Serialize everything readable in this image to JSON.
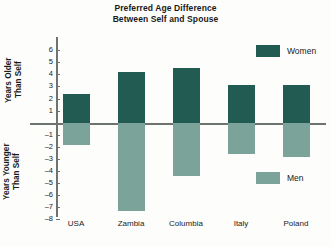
{
  "chart_data": {
    "type": "bar",
    "title": "Preferred Age Difference Between Self and Spouse",
    "title_lines": [
      "Preferred Age Difference",
      "Between Self and Spouse"
    ],
    "categories": [
      "USA",
      "Zambia",
      "Columbia",
      "Italy",
      "Poland"
    ],
    "series": [
      {
        "name": "Women",
        "axis": "upper",
        "color": "#215b51",
        "values": [
          2.4,
          4.15,
          4.45,
          3.1,
          3.1
        ]
      },
      {
        "name": "Men",
        "axis": "lower",
        "color": "#7ba399",
        "values": [
          -1.85,
          -7.3,
          -4.4,
          -2.55,
          -2.8
        ]
      }
    ],
    "upper_axis": {
      "label": "Years Older Than Self",
      "label_lines": [
        "Years Older",
        "Than Self"
      ],
      "ticks": [
        1,
        2,
        3,
        4,
        5,
        6
      ],
      "tick_labels": [
        "1",
        "2",
        "3",
        "4",
        "5",
        "6"
      ],
      "ylim": [
        0,
        6
      ]
    },
    "lower_axis": {
      "label": "Years Younger Than Self",
      "label_lines": [
        "Years Younger",
        "Than Self"
      ],
      "ticks": [
        -1,
        -2,
        -3,
        -4,
        -5,
        -6,
        -7,
        -8
      ],
      "tick_labels": [
        "–1",
        "–2",
        "–3",
        "–4",
        "–5",
        "–6",
        "–7",
        "–8"
      ],
      "ylim": [
        -8,
        0
      ]
    },
    "xlabel": "",
    "ylabel": "Years Older / Younger Than Self",
    "grid": false,
    "legend": [
      {
        "name": "Women",
        "color": "#215b51"
      },
      {
        "name": "Men",
        "color": "#7ba399"
      }
    ],
    "legend_position": "right"
  }
}
